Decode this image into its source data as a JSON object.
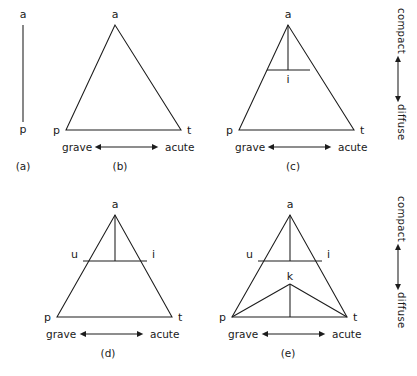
{
  "figure": {
    "title_hidden": "",
    "ink_color": "#1c1c1c",
    "background_color": "#ffffff",
    "vertical_axis": {
      "top_label": "compact",
      "bottom_label": "diffuse",
      "arrow": "double-headed-vertical"
    },
    "horizontal_axis": {
      "left_label": "grave",
      "right_label": "acute",
      "arrow": "double-headed-horizontal"
    },
    "panels": [
      {
        "caption": "(a)",
        "type": "line",
        "vertices": [
          {
            "label": "a",
            "position": "top"
          },
          {
            "label": "p",
            "position": "bottom"
          }
        ],
        "has_axis": false
      },
      {
        "caption": "(b)",
        "type": "triangle",
        "vertices": [
          {
            "label": "a",
            "position": "apex"
          },
          {
            "label": "p",
            "position": "bottom-left"
          },
          {
            "label": "t",
            "position": "bottom-right"
          }
        ],
        "has_axis": true
      },
      {
        "caption": "(c)",
        "type": "triangle-with-median",
        "vertices": [
          {
            "label": "a",
            "position": "apex"
          },
          {
            "label": "p",
            "position": "bottom-left"
          },
          {
            "label": "t",
            "position": "bottom-right"
          },
          {
            "label": "i",
            "position": "mid-crossbar"
          }
        ],
        "has_axis": true
      },
      {
        "caption": "(d)",
        "type": "triangle-with-crossbar",
        "vertices": [
          {
            "label": "a",
            "position": "apex"
          },
          {
            "label": "p",
            "position": "bottom-left"
          },
          {
            "label": "t",
            "position": "bottom-right"
          },
          {
            "label": "u",
            "position": "crossbar-left"
          },
          {
            "label": "i",
            "position": "crossbar-right"
          }
        ],
        "has_axis": true
      },
      {
        "caption": "(e)",
        "type": "triangle-with-crossbar-and-inner-triangle",
        "vertices": [
          {
            "label": "a",
            "position": "apex"
          },
          {
            "label": "p",
            "position": "bottom-left"
          },
          {
            "label": "t",
            "position": "bottom-right"
          },
          {
            "label": "u",
            "position": "crossbar-left"
          },
          {
            "label": "i",
            "position": "crossbar-right"
          },
          {
            "label": "k",
            "position": "inner-apex"
          }
        ],
        "has_axis": true
      }
    ]
  }
}
